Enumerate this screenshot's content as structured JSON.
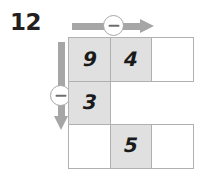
{
  "worksheet": {
    "problem_number": "12"
  },
  "controls": {
    "horizontal": {
      "arrow_icon": "arrow-right-icon",
      "operation_icon": "minus-circle-icon",
      "operation_symbol": "−",
      "direction": "right"
    },
    "vertical": {
      "arrow_icon": "arrow-down-icon",
      "operation_icon": "minus-circle-icon",
      "operation_symbol": "−",
      "direction": "down"
    }
  },
  "colors": {
    "arrow": "#a6a6a6",
    "cell_fill": "#e0e0e0",
    "cell_border": "#b0b0b0",
    "digit": "#1a1a1a",
    "label": "#231f20",
    "badge_bg": "#ffffff",
    "badge_glyph": "#6d6d6d"
  },
  "grid": {
    "rows": 3,
    "columns": 3,
    "cells": [
      [
        {
          "value": "9",
          "state": "filled",
          "bordered": true
        },
        {
          "value": "4",
          "state": "filled",
          "bordered": true
        },
        {
          "value": "",
          "state": "open",
          "bordered": true
        }
      ],
      [
        {
          "value": "3",
          "state": "filled",
          "bordered": true
        },
        {
          "value": "",
          "state": "blank",
          "bordered": false
        },
        {
          "value": "",
          "state": "blank",
          "bordered": false
        }
      ],
      [
        {
          "value": "",
          "state": "open",
          "bordered": true
        },
        {
          "value": "5",
          "state": "filled",
          "bordered": true
        },
        {
          "value": "",
          "state": "open",
          "bordered": true
        }
      ]
    ]
  }
}
